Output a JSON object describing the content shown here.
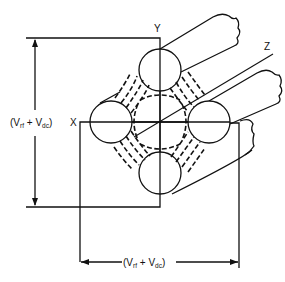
{
  "figure": {
    "axes": {
      "x_label": "X",
      "y_label": "Y",
      "z_label": "Z"
    },
    "dimensions": {
      "vertical": {
        "open": "(V",
        "sub1": "rf",
        "plus": " + V",
        "sub2": "dc",
        "close": ")"
      },
      "horizontal": {
        "open": "(V",
        "sub1": "rf",
        "plus": " + V",
        "sub2": "dc",
        "close": ")"
      }
    },
    "rods": [
      {
        "name": "top-rod",
        "position": "top"
      },
      {
        "name": "left-rod",
        "position": "left"
      },
      {
        "name": "right-rod",
        "position": "right"
      },
      {
        "name": "bottom-rod",
        "position": "bottom"
      }
    ],
    "colors": {
      "line": "#111111",
      "background": "#ffffff"
    }
  }
}
